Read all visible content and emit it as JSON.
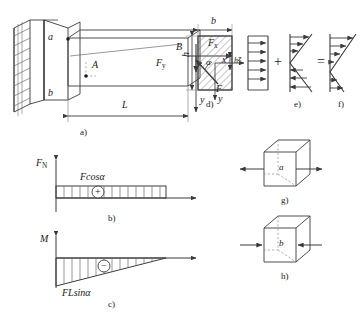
{
  "figure": {
    "stroke_color": "#3a3a3a",
    "hatch_color": "#6b6b6b",
    "text_color": "#1a1a1a"
  },
  "panels": {
    "a": {
      "caption": "a)",
      "labels": {
        "point_a": "a",
        "point_b": "b",
        "section_A": "A",
        "point_B": "B",
        "force_x": "F",
        "force_x_sub": "x",
        "force_y": "F",
        "force_y_sub": "y",
        "force": "F",
        "angle": "α",
        "axis_x": "x",
        "axis_y": "y",
        "length": "L"
      }
    },
    "d": {
      "caption": "d)",
      "labels": {
        "width": "b",
        "height": "h",
        "axis_y": "y",
        "axis_z": "z",
        "centroid": "h"
      }
    },
    "e": {
      "caption": "e)"
    },
    "f": {
      "caption": "f)"
    },
    "b": {
      "caption": "b)",
      "labels": {
        "axis": "F",
        "axis_sub": "N",
        "value": "Fcosα",
        "sign": "+"
      }
    },
    "c": {
      "caption": "c)",
      "labels": {
        "axis": "M",
        "value": "FLsinα",
        "sign": "−"
      }
    },
    "g": {
      "caption": "g)",
      "labels": {
        "point": "a"
      }
    },
    "h": {
      "caption": "h)",
      "labels": {
        "point": "b"
      }
    }
  },
  "operators": {
    "plus": "+",
    "equals": "="
  }
}
